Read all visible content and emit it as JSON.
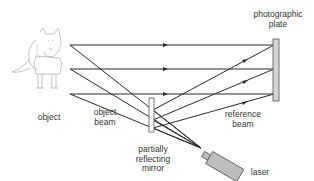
{
  "labels": {
    "object": "object",
    "object_beam": "object\nbeam",
    "mirror": "partially\nreflecting\nmirror",
    "plate": "photographic\nplate",
    "reference_beam": "reference\nbeam",
    "laser": "laser"
  },
  "components": [
    "object (wolf)",
    "photographic plate",
    "partially reflecting mirror",
    "laser"
  ],
  "colors": {
    "line": "#2a2a2a",
    "plate_fill": "#d4d4d4",
    "laser_fill": "#bdbdbd",
    "text": "#333333"
  }
}
